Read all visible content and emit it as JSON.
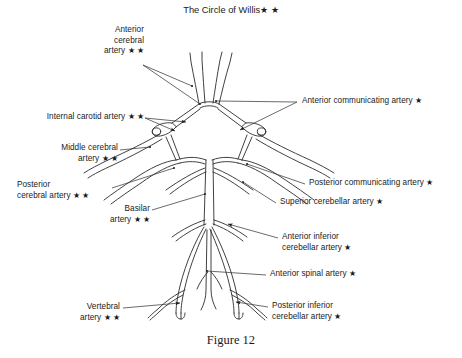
{
  "title": "The Circle of Willis★ ★",
  "caption": "Figure 12",
  "figure_type": "anatomical-diagram",
  "labels": {
    "anterior_cerebral_artery": "Anterior\ncerebral\nartery ★ ★",
    "internal_carotid_artery": "Internal carotid artery ★ ★",
    "middle_cerebral_artery": "Middle cerebral\nartery ★ ★",
    "posterior_cerebral_artery": "Posterior\ncerebral artery ★ ★",
    "basilar_artery": "Basilar\nartery ★ ★",
    "vertebral_artery": "Vertebral\nartery ★ ★",
    "anterior_communicating_artery": "Anterior communicating artery ★",
    "posterior_communicating_artery": "Posterior communicating artery ★",
    "superior_cerebellar_artery": "Superior cerebellar artery ★",
    "anterior_inferior_cerebellar_artery": "Anterior inferior\ncerebellar artery ★",
    "anterior_spinal_artery": "Anterior spinal artery ★",
    "posterior_inferior_cerebellar_artery": "Posterior inferior\ncerebellar artery ★"
  },
  "colors": {
    "ink": "#1a1a1a",
    "vessel_stroke": "#2b2b2b",
    "leader_stroke": "#3a3a3a",
    "background": "#ffffff"
  }
}
